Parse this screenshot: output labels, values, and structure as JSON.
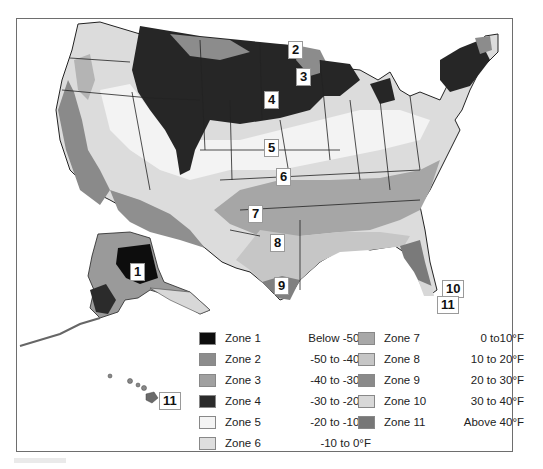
{
  "map": {
    "subject": "USDA plant hardiness zone map of the United States",
    "zone_labels": [
      {
        "id": "1",
        "text": "1"
      },
      {
        "id": "2",
        "text": "2"
      },
      {
        "id": "3",
        "text": "3"
      },
      {
        "id": "4",
        "text": "4"
      },
      {
        "id": "5",
        "text": "5"
      },
      {
        "id": "6",
        "text": "6"
      },
      {
        "id": "7",
        "text": "7"
      },
      {
        "id": "8",
        "text": "8"
      },
      {
        "id": "9",
        "text": "9"
      },
      {
        "id": "10",
        "text": "10"
      },
      {
        "id": "11a",
        "text": "11"
      },
      {
        "id": "11b",
        "text": "11"
      }
    ]
  },
  "legend": {
    "items": [
      {
        "zone": "Zone  1",
        "range": "Below -50°F",
        "color": "#0d0d0d"
      },
      {
        "zone": "Zone  2",
        "range": "-50 to -40°F",
        "color": "#8c8c8c"
      },
      {
        "zone": "Zone  3",
        "range": "-40 to -30°F",
        "color": "#a0a0a0"
      },
      {
        "zone": "Zone  4",
        "range": "-30 to -20°F",
        "color": "#2b2b2b"
      },
      {
        "zone": "Zone  5",
        "range": "-20 to -10°F",
        "color": "#f4f4f4"
      },
      {
        "zone": "Zone  6",
        "range": "-10 to 0°F",
        "color": "#dedede"
      },
      {
        "zone": "Zone  7",
        "range": "0 to10°F",
        "color": "#a8a8a8"
      },
      {
        "zone": "Zone  8",
        "range": "10 to 20°F",
        "color": "#c6c6c6"
      },
      {
        "zone": "Zone  9",
        "range": "20 to 30°F",
        "color": "#8a8a8a"
      },
      {
        "zone": "Zone 10",
        "range": "30 to 40°F",
        "color": "#d8d8d8"
      },
      {
        "zone": "Zone 11",
        "range": "Above 40°F",
        "color": "#777777"
      }
    ]
  }
}
